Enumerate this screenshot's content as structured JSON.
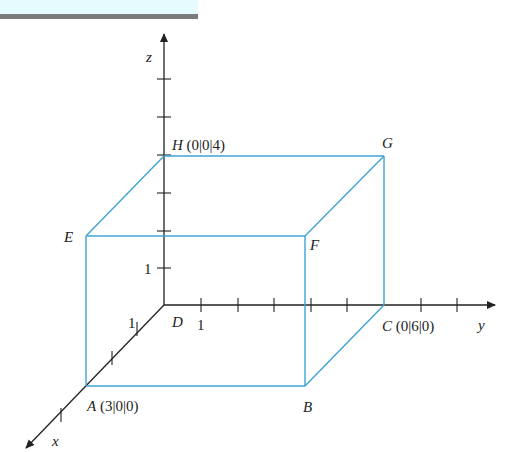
{
  "diagram": {
    "type": "3d-cuboid-coordinate-system",
    "colors": {
      "axis": "#222222",
      "box": "#3fa3d4",
      "banner": "#e6fbfd",
      "bar": "#7a7a7a"
    },
    "axes": {
      "x": "x",
      "y": "y",
      "z": "z"
    },
    "unit_labels": {
      "x": "1",
      "y": "1",
      "z": "1"
    },
    "points": {
      "A": {
        "name": "A",
        "coords": "(3|0|0)"
      },
      "B": {
        "name": "B",
        "coords": ""
      },
      "C": {
        "name": "C",
        "coords": "(0|6|0)"
      },
      "D": {
        "name": "D",
        "coords": ""
      },
      "E": {
        "name": "E",
        "coords": ""
      },
      "F": {
        "name": "F",
        "coords": ""
      },
      "G": {
        "name": "G",
        "coords": ""
      },
      "H": {
        "name": "H",
        "coords": "(0|0|4)"
      }
    }
  }
}
